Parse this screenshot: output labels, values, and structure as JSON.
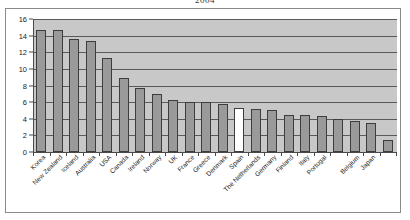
{
  "chart_data": {
    "type": "bar",
    "title": "2004",
    "xlabel": "",
    "ylabel": "",
    "ylim": [
      0,
      16
    ],
    "ytick_step": 2,
    "yticks": [
      0,
      2,
      4,
      6,
      8,
      10,
      12,
      14,
      16
    ],
    "grid": true,
    "legend": false,
    "highlight_category": "Spain",
    "highlight_color": "#ffffff",
    "bar_color": "#9a9a9a",
    "bar_border_color": "#3d3d3d",
    "plot_background": "#c8c8c8",
    "figure_background": "#ffffff",
    "categories": [
      "Korea",
      "New Zealand",
      "Iceland",
      "Australia",
      "USA",
      "Canada",
      "Ireland",
      "Norway",
      "UK",
      "France",
      "Greece",
      "Denmark",
      "Spain",
      "The Netherlands",
      "Germany",
      "Finland",
      "Italy",
      "Portugal",
      "Belgium",
      "Japan"
    ],
    "values": [
      14.7,
      14.7,
      13.6,
      13.4,
      11.3,
      8.9,
      7.7,
      7.0,
      6.3,
      6.0,
      6.0,
      5.8,
      5.3,
      5.2,
      5.1,
      4.5,
      4.4,
      4.3,
      3.7,
      3.55
    ],
    "extra_bars": [
      {
        "after_category": "Portugal",
        "value": 4.0
      },
      {
        "after_category": "Japan",
        "value": 1.5
      }
    ]
  }
}
